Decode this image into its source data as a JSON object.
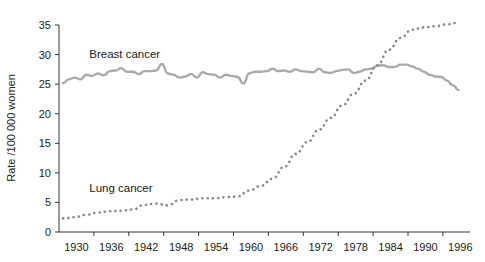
{
  "chart_data": {
    "type": "line",
    "title": "",
    "xlabel": "",
    "ylabel": "Rate /100 000 women",
    "ylim": [
      0,
      35
    ],
    "yticks": [
      0,
      5,
      10,
      15,
      20,
      25,
      30,
      35
    ],
    "xtick_labels": [
      "1930",
      "1936",
      "1942",
      "1948",
      "1954",
      "1960",
      "1966",
      "1972",
      "1978",
      "1984",
      "1990",
      "1996"
    ],
    "grid": false,
    "legend": "inline labels",
    "series": [
      {
        "name": "Breast cancer",
        "style": "solid",
        "color": "#aaaaaa",
        "label_pos": {
          "year": 1932.5,
          "value": 29.5
        },
        "x": [
          1928,
          1929,
          1930,
          1931,
          1932,
          1933,
          1934,
          1935,
          1936,
          1937,
          1938,
          1939,
          1940,
          1941,
          1942,
          1943,
          1944,
          1945,
          1946,
          1947,
          1948,
          1949,
          1950,
          1951,
          1952,
          1953,
          1954,
          1955,
          1956,
          1957,
          1958,
          1959,
          1960,
          1961,
          1962,
          1963,
          1964,
          1965,
          1966,
          1967,
          1968,
          1969,
          1970,
          1971,
          1972,
          1973,
          1974,
          1975,
          1976,
          1977,
          1978,
          1979,
          1980,
          1981,
          1982,
          1983,
          1984,
          1985,
          1986,
          1987,
          1988,
          1989,
          1990,
          1991,
          1992,
          1993,
          1994,
          1995,
          1996
        ],
        "values": [
          25.2,
          25.8,
          26.1,
          25.8,
          26.6,
          26.4,
          26.8,
          26.5,
          27.2,
          27.3,
          27.7,
          27.1,
          27.1,
          26.7,
          27.2,
          27.2,
          27.3,
          28.4,
          26.8,
          26.6,
          26.1,
          26.3,
          26.7,
          26.1,
          27.0,
          26.7,
          26.6,
          26.1,
          26.6,
          26.4,
          26.2,
          25.1,
          26.8,
          27.1,
          27.1,
          27.2,
          27.6,
          27.2,
          27.3,
          27.1,
          27.5,
          27.2,
          27.1,
          27.0,
          27.6,
          27.0,
          26.9,
          27.2,
          27.4,
          27.5,
          26.9,
          27.1,
          27.5,
          27.6,
          28.1,
          28.2,
          27.9,
          27.9,
          28.3,
          28.3,
          28.0,
          27.6,
          27.1,
          26.6,
          26.3,
          26.2,
          25.6,
          24.8,
          24.0
        ]
      },
      {
        "name": "Lung cancer",
        "style": "dotted",
        "color": "#888888",
        "label_pos": {
          "year": 1932.5,
          "value": 6.7
        },
        "x": [
          1928,
          1930,
          1932,
          1934,
          1936,
          1938,
          1940,
          1942,
          1944,
          1946,
          1948,
          1950,
          1952,
          1954,
          1956,
          1958,
          1960,
          1962,
          1964,
          1966,
          1968,
          1970,
          1972,
          1974,
          1976,
          1978,
          1980,
          1982,
          1984,
          1986,
          1988,
          1990,
          1992,
          1994,
          1996
        ],
        "values": [
          2.3,
          2.5,
          2.9,
          3.3,
          3.5,
          3.6,
          3.8,
          4.6,
          4.8,
          4.5,
          5.4,
          5.5,
          5.7,
          5.7,
          5.9,
          6.0,
          7.0,
          7.8,
          9.0,
          11.0,
          13.2,
          15.2,
          17.3,
          19.3,
          21.4,
          23.4,
          25.6,
          28.2,
          30.8,
          32.8,
          34.2,
          34.6,
          34.8,
          35.1,
          35.4
        ]
      }
    ]
  }
}
